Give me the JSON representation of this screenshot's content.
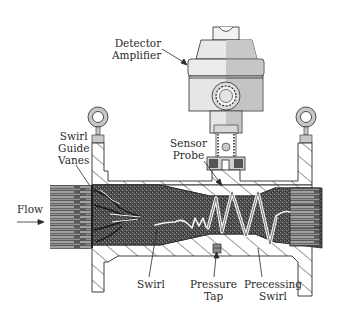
{
  "diagram": {
    "labels": {
      "detector_amplifier": [
        "Detector",
        "Amplifier"
      ],
      "sensor_probe": [
        "Sensor",
        "Probe"
      ],
      "swirl_guide_vanes": [
        "Swirl",
        "Guide",
        "Vanes"
      ],
      "flow": "Flow",
      "swirl": "Swirl",
      "pressure_tap": [
        "Pressure",
        "Tap"
      ],
      "precessing_swirl": [
        "Precessing",
        "Swirl"
      ]
    },
    "colors": {
      "outline": "#2a2a2a",
      "housing_light": "#e8e8e8",
      "housing_shade": "#c4c4c4",
      "flow_fill": "#555555",
      "swirl_white": "#f4f4f4",
      "hatch": "#3a3a3a"
    }
  }
}
